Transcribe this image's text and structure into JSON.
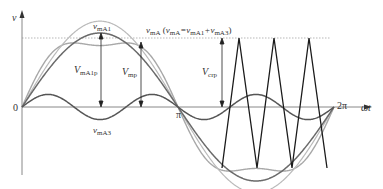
{
  "figure": {
    "axes": {
      "y_label": "v",
      "x_label": "ωt",
      "origin_label": "0",
      "tick_pi": "π",
      "tick_2pi": "2π"
    },
    "curves": {
      "fundamental": {
        "name": "vmA1",
        "label_main": "v",
        "label_sub": "mA1",
        "color": "#6a6a6a"
      },
      "third_harmonic": {
        "name": "vmA3",
        "label_main": "v",
        "label_sub": "mA3",
        "color": "#555555"
      },
      "sum": {
        "name": "vmA",
        "label_main": "v",
        "label_sub": "mA",
        "equation_open": " (",
        "eq_v": "v",
        "eq_sub1": "mA",
        "eq_mid": "=v",
        "eq_sub2": "mA1",
        "eq_plus": "+v",
        "eq_sub3": "mA3",
        "equation_close": ")",
        "color": "#a8a8a8"
      },
      "carrier": {
        "name": "triangle carrier",
        "color": "#1a1a1a"
      }
    },
    "annotations": {
      "VmA1p": {
        "main": "V",
        "sub": "mA1p"
      },
      "Vmp": {
        "main": "V",
        "sub": "mp"
      },
      "Vcrp": {
        "main": "V",
        "sub": "crp"
      }
    },
    "parameters": {
      "fundamental_amplitude": 1.0,
      "third_harmonic_amplitude_ratio": 0.17,
      "carrier_peaks_per_period": 3,
      "carrier_shown_from": "~1.3π to 2π"
    }
  }
}
